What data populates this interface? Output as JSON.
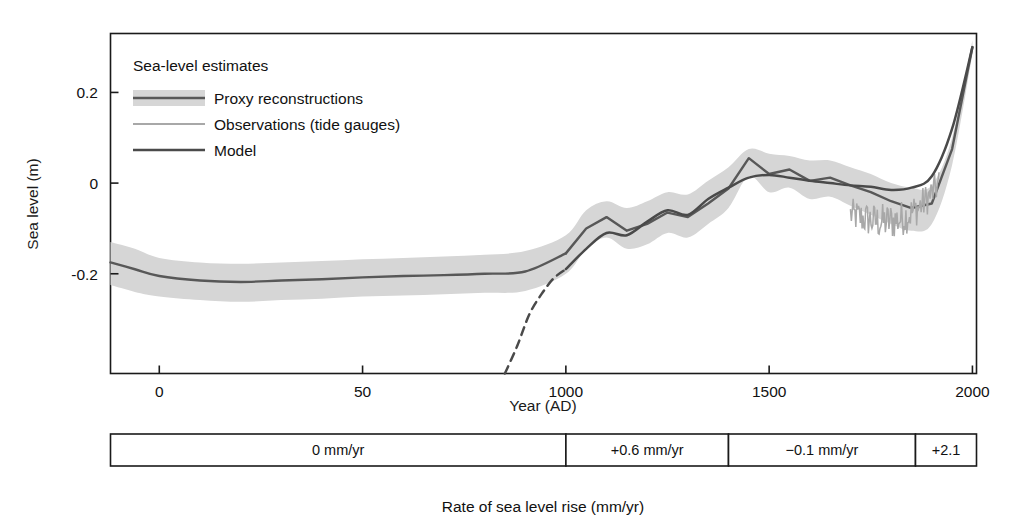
{
  "chart_data": {
    "type": "line",
    "title": "",
    "xlabel": "Year (AD)",
    "ylabel": "Sea level (m)",
    "xlim": [
      -120,
      2010
    ],
    "ylim": [
      -0.42,
      0.33
    ],
    "xticks": [
      0,
      500,
      1000,
      1500,
      2000
    ],
    "xtick_labels": [
      "0",
      "50",
      "1000",
      "1500",
      "2000"
    ],
    "yticks": [
      0.2,
      0,
      -0.2
    ],
    "ytick_labels": [
      "0.2",
      "0",
      "-0.2"
    ],
    "grid": false,
    "legend_position": "upper-left",
    "legend_title": "Sea-level estimates",
    "series": [
      {
        "name": "Proxy reconstructions",
        "style": "band-with-line",
        "color": "#585858",
        "band_color": "#d6d6d6",
        "x": [
          -120,
          -60,
          0,
          100,
          200,
          300,
          400,
          500,
          600,
          700,
          800,
          900,
          1000,
          1050,
          1100,
          1150,
          1200,
          1250,
          1300,
          1350,
          1400,
          1450,
          1500,
          1550,
          1600,
          1650,
          1700,
          1750,
          1800,
          1850,
          1900,
          1950,
          2000
        ],
        "y": [
          -0.175,
          -0.19,
          -0.205,
          -0.215,
          -0.218,
          -0.215,
          -0.212,
          -0.208,
          -0.205,
          -0.203,
          -0.2,
          -0.195,
          -0.155,
          -0.1,
          -0.075,
          -0.105,
          -0.09,
          -0.065,
          -0.075,
          -0.045,
          -0.012,
          0.055,
          0.02,
          0.03,
          0.005,
          0.012,
          -0.005,
          -0.02,
          -0.04,
          -0.055,
          -0.045,
          0.075,
          0.3
        ],
        "band_upper": [
          -0.13,
          -0.145,
          -0.165,
          -0.175,
          -0.178,
          -0.175,
          -0.172,
          -0.168,
          -0.165,
          -0.162,
          -0.158,
          -0.15,
          -0.115,
          -0.06,
          -0.04,
          -0.055,
          -0.04,
          -0.02,
          -0.025,
          0.005,
          0.035,
          0.075,
          0.065,
          0.06,
          0.05,
          0.05,
          0.035,
          0.02,
          0.0,
          -0.01,
          -0.005,
          0.1,
          0.315
        ],
        "band_lower": [
          -0.225,
          -0.24,
          -0.25,
          -0.258,
          -0.262,
          -0.258,
          -0.255,
          -0.25,
          -0.248,
          -0.245,
          -0.242,
          -0.238,
          -0.2,
          -0.145,
          -0.12,
          -0.145,
          -0.135,
          -0.11,
          -0.12,
          -0.09,
          -0.055,
          0.015,
          -0.02,
          -0.01,
          -0.035,
          -0.03,
          -0.05,
          -0.07,
          -0.09,
          -0.105,
          -0.09,
          0.04,
          0.285
        ]
      },
      {
        "name": "Observations (tide gauges)",
        "style": "noisy-line",
        "color": "#a8a8a8",
        "x_start": 1700,
        "x_end": 1920,
        "y_mean": -0.06
      },
      {
        "name": "Model",
        "style": "line",
        "color": "#4a4a4a",
        "x": [
          850,
          880,
          910,
          940,
          970,
          1000,
          1050,
          1100,
          1150,
          1200,
          1250,
          1300,
          1350,
          1400,
          1450,
          1500,
          1550,
          1600,
          1650,
          1700,
          1750,
          1800,
          1850,
          1900,
          1950,
          2000
        ],
        "y": [
          -0.42,
          -0.36,
          -0.29,
          -0.245,
          -0.21,
          -0.19,
          -0.145,
          -0.11,
          -0.115,
          -0.085,
          -0.06,
          -0.07,
          -0.035,
          -0.01,
          0.012,
          0.018,
          0.012,
          0.005,
          0.0,
          -0.005,
          -0.008,
          -0.015,
          -0.01,
          0.015,
          0.12,
          0.3
        ],
        "dashed_until": 1000
      }
    ],
    "annotations": []
  },
  "legend": {
    "title": "Sea-level estimates",
    "entries": [
      {
        "label": "Proxy reconstructions",
        "swatch": "band"
      },
      {
        "label": "Observations (tide gauges)",
        "swatch": "light-line"
      },
      {
        "label": "Model",
        "swatch": "dark-line"
      }
    ]
  },
  "rate_bar": {
    "caption": "Rate of sea level rise (mm/yr)",
    "cells": [
      {
        "label": "0 mm/yr",
        "x_start": -120,
        "x_end": 1000
      },
      {
        "label": "+0.6 mm/yr",
        "x_start": 1000,
        "x_end": 1400
      },
      {
        "label": "−0.1 mm/yr",
        "x_start": 1400,
        "x_end": 1860
      },
      {
        "label": "+2.1",
        "x_start": 1860,
        "x_end": 2010
      }
    ]
  },
  "colors": {
    "axis": "#1a1a1a",
    "band": "#d6d6d6",
    "proxy_line": "#585858",
    "model_line": "#4a4a4a",
    "tide_gauge": "#a8a8a8"
  }
}
